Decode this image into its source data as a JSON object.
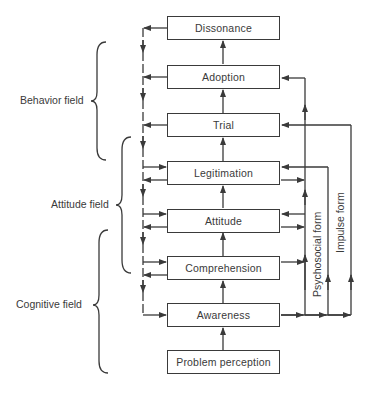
{
  "diagram": {
    "stages": [
      {
        "id": "dissonance",
        "label": "Dissonance"
      },
      {
        "id": "adoption",
        "label": "Adoption"
      },
      {
        "id": "trial",
        "label": "Trial"
      },
      {
        "id": "legitimation",
        "label": "Legitimation"
      },
      {
        "id": "attitude",
        "label": "Attitude"
      },
      {
        "id": "comprehension",
        "label": "Comprehension"
      },
      {
        "id": "awareness",
        "label": "Awareness"
      },
      {
        "id": "problem_perception",
        "label": "Problem perception"
      }
    ],
    "fields": [
      {
        "id": "behavior",
        "label": "Behavior field"
      },
      {
        "id": "attitude",
        "label": "Attitude field"
      },
      {
        "id": "cognitive",
        "label": "Cognitive field"
      }
    ],
    "paths": [
      {
        "id": "psychosocial",
        "label": "Psychosocial form"
      },
      {
        "id": "impulse",
        "label": "Impulse form"
      }
    ],
    "colors": {
      "line": "#3a3a3a",
      "background": "#ffffff"
    }
  }
}
